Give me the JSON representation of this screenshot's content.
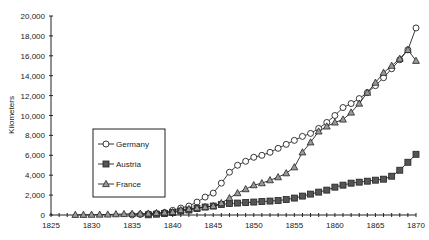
{
  "chart_data": {
    "type": "line",
    "title": "",
    "xlabel": "",
    "ylabel": "Kilometers",
    "xlim": [
      1825,
      1870
    ],
    "ylim": [
      0,
      20000
    ],
    "grid": false,
    "legend_position": "inside-left",
    "x_ticks": [
      "1825",
      "1830",
      "1835",
      "1840",
      "1845",
      "1850",
      "1855",
      "1860",
      "1865",
      "1870"
    ],
    "y_ticks": [
      "0",
      "2,000",
      "4,000",
      "6,000",
      "8,000",
      "10,000",
      "12,000",
      "14,000",
      "16,000",
      "18,000",
      "20,000"
    ],
    "x": [
      1828,
      1829,
      1830,
      1831,
      1832,
      1833,
      1834,
      1835,
      1836,
      1837,
      1838,
      1839,
      1840,
      1841,
      1842,
      1843,
      1844,
      1845,
      1846,
      1847,
      1848,
      1849,
      1850,
      1851,
      1852,
      1853,
      1854,
      1855,
      1856,
      1857,
      1858,
      1859,
      1860,
      1861,
      1862,
      1863,
      1864,
      1865,
      1866,
      1867,
      1868,
      1869,
      1870
    ],
    "series": [
      {
        "name": "Germany",
        "marker": "open-circle",
        "values": [
          null,
          null,
          null,
          null,
          null,
          null,
          null,
          6,
          50,
          100,
          150,
          250,
          470,
          700,
          900,
          1300,
          1800,
          2200,
          3200,
          4300,
          5000,
          5400,
          5800,
          6000,
          6300,
          6700,
          7100,
          7500,
          7900,
          8200,
          8700,
          9300,
          10000,
          10800,
          11200,
          11700,
          12300,
          13000,
          13800,
          14700,
          15600,
          16600,
          18800
        ]
      },
      {
        "name": "Austria",
        "marker": "filled-square",
        "values": [
          null,
          null,
          null,
          null,
          null,
          null,
          null,
          null,
          null,
          20,
          80,
          150,
          250,
          400,
          500,
          650,
          800,
          900,
          1050,
          1150,
          1200,
          1250,
          1300,
          1350,
          1400,
          1450,
          1550,
          1700,
          1900,
          2100,
          2300,
          2500,
          2800,
          3000,
          3200,
          3300,
          3400,
          3500,
          3600,
          3900,
          4500,
          5300,
          6100
        ]
      },
      {
        "name": "France",
        "marker": "triangle",
        "values": [
          20,
          20,
          30,
          40,
          50,
          80,
          100,
          120,
          130,
          150,
          200,
          250,
          300,
          500,
          600,
          700,
          800,
          900,
          1200,
          1700,
          2200,
          2600,
          3000,
          3200,
          3500,
          3800,
          4200,
          4800,
          6300,
          7300,
          8400,
          8900,
          9300,
          9600,
          10300,
          11200,
          12300,
          13300,
          14300,
          15000,
          15700,
          16600,
          15500
        ]
      }
    ]
  },
  "legend": {
    "items": [
      {
        "label": "Germany"
      },
      {
        "label": "Austria"
      },
      {
        "label": "France"
      }
    ]
  },
  "axes": {
    "ylabel": "Kilometers"
  }
}
